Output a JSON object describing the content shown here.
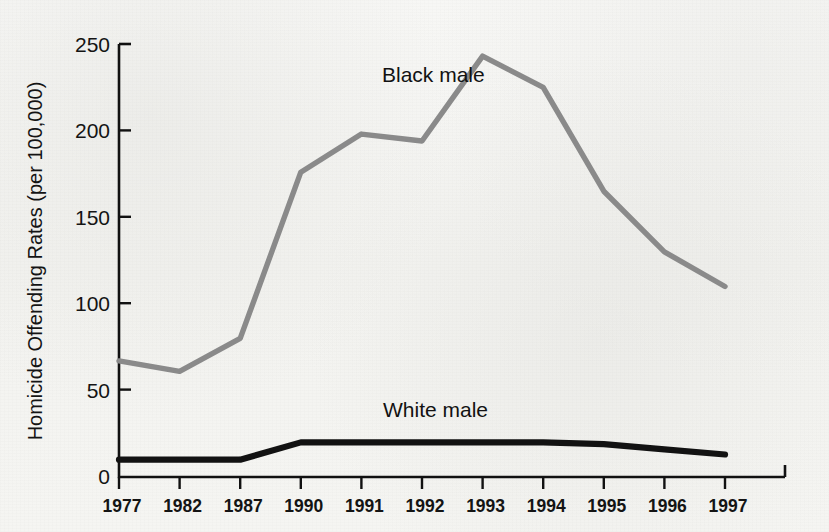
{
  "chart_data": {
    "type": "line",
    "title": "",
    "xlabel": "",
    "ylabel": "Homicide Offending Rates  (per 100,000)",
    "categories": [
      "1977",
      "1982",
      "1987",
      "1990",
      "1991",
      "1992",
      "1993",
      "1994",
      "1995",
      "1996",
      "1997"
    ],
    "x_tick_labels": [
      "1977",
      "1982",
      "1987",
      "1990",
      "1991",
      "1992",
      "1993",
      "1994",
      "1995",
      "1996",
      "1997"
    ],
    "y_tick_labels": [
      "0",
      "50",
      "100",
      "150",
      "200",
      "250"
    ],
    "y_ticks": [
      0,
      50,
      100,
      150,
      200,
      250
    ],
    "ylim": [
      0,
      250
    ],
    "grid": false,
    "legend_position": "inline-annotation",
    "series": [
      {
        "name": "Black male",
        "label": "Black male",
        "color": "#8a8a8a",
        "values": [
          67,
          61,
          80,
          176,
          198,
          194,
          243,
          225,
          165,
          130,
          110
        ]
      },
      {
        "name": "White male",
        "label": "White male",
        "color": "#121212",
        "values": [
          10,
          10,
          10,
          20,
          20,
          20,
          20,
          20,
          19,
          16,
          13
        ]
      }
    ],
    "annotations": [
      {
        "text": "Black male",
        "x_px": 382,
        "y_px": 82
      },
      {
        "text": "White male",
        "x_px": 383,
        "y_px": 417
      }
    ]
  },
  "colors": {
    "background": "#f4f4f2",
    "axis": "#111111",
    "black_male_line": "#8a8a8a",
    "white_male_line": "#121212"
  }
}
